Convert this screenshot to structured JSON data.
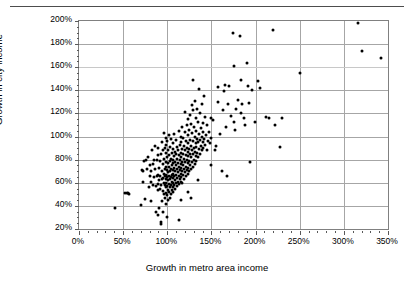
{
  "chart_data": {
    "type": "scatter",
    "title": "",
    "xlabel": "Growth in metro area income",
    "ylabel": "Growth in city income",
    "xlim": [
      0,
      350
    ],
    "ylim": [
      20,
      200
    ],
    "xtick_labels": [
      "0%",
      "50%",
      "100%",
      "150%",
      "200%",
      "250%",
      "300%",
      "350%"
    ],
    "xtick_values": [
      0,
      50,
      100,
      150,
      200,
      250,
      300,
      350
    ],
    "ytick_labels": [
      "20%",
      "40%",
      "60%",
      "80%",
      "100%",
      "120%",
      "140%",
      "160%",
      "180%",
      "200%"
    ],
    "ytick_values": [
      20,
      40,
      60,
      80,
      100,
      120,
      140,
      160,
      180,
      200
    ],
    "x_minor_tick_step": 10,
    "y_minor_tick_step": 5,
    "grid": {
      "vertical": true,
      "horizontal": true
    },
    "legend": null,
    "marker": {
      "shape": "circle",
      "color": "#000000",
      "size_px": 3
    },
    "units": "percent",
    "n_points": 268,
    "points": [
      [
        41,
        38
      ],
      [
        52,
        51
      ],
      [
        54,
        51
      ],
      [
        56,
        51
      ],
      [
        57,
        50
      ],
      [
        70,
        41
      ],
      [
        71,
        71
      ],
      [
        72,
        70
      ],
      [
        73,
        61
      ],
      [
        74,
        79
      ],
      [
        75,
        46
      ],
      [
        76,
        80
      ],
      [
        77,
        72
      ],
      [
        78,
        82
      ],
      [
        79,
        56
      ],
      [
        80,
        66
      ],
      [
        80,
        75
      ],
      [
        81,
        70
      ],
      [
        82,
        44
      ],
      [
        82,
        61
      ],
      [
        83,
        88
      ],
      [
        84,
        76
      ],
      [
        84,
        58
      ],
      [
        85,
        80
      ],
      [
        85,
        65
      ],
      [
        86,
        72
      ],
      [
        86,
        92
      ],
      [
        87,
        35
      ],
      [
        87,
        57
      ],
      [
        88,
        66
      ],
      [
        88,
        80
      ],
      [
        89,
        32
      ],
      [
        89,
        59
      ],
      [
        89,
        84
      ],
      [
        90,
        54
      ],
      [
        90,
        67
      ],
      [
        90,
        90
      ],
      [
        91,
        38
      ],
      [
        91,
        62
      ],
      [
        91,
        73
      ],
      [
        92,
        55
      ],
      [
        92,
        66
      ],
      [
        92,
        79
      ],
      [
        93,
        24
      ],
      [
        93,
        26
      ],
      [
        93,
        58
      ],
      [
        93,
        85
      ],
      [
        94,
        44
      ],
      [
        94,
        63
      ],
      [
        94,
        70
      ],
      [
        94,
        95
      ],
      [
        95,
        35
      ],
      [
        95,
        53
      ],
      [
        95,
        64
      ],
      [
        95,
        76
      ],
      [
        95,
        88
      ],
      [
        96,
        50
      ],
      [
        96,
        60
      ],
      [
        96,
        68
      ],
      [
        96,
        81
      ],
      [
        96,
        103
      ],
      [
        97,
        47
      ],
      [
        97,
        58
      ],
      [
        97,
        66
      ],
      [
        97,
        72
      ],
      [
        97,
        90
      ],
      [
        98,
        42
      ],
      [
        98,
        56
      ],
      [
        98,
        63
      ],
      [
        98,
        74
      ],
      [
        98,
        86
      ],
      [
        98,
        99
      ],
      [
        99,
        51
      ],
      [
        99,
        60
      ],
      [
        99,
        67
      ],
      [
        99,
        78
      ],
      [
        99,
        93
      ],
      [
        100,
        30
      ],
      [
        100,
        49
      ],
      [
        100,
        57
      ],
      [
        100,
        65
      ],
      [
        100,
        71
      ],
      [
        100,
        82
      ],
      [
        100,
        96
      ],
      [
        101,
        45
      ],
      [
        101,
        54
      ],
      [
        101,
        62
      ],
      [
        101,
        69
      ],
      [
        101,
        77
      ],
      [
        101,
        88
      ],
      [
        102,
        52
      ],
      [
        102,
        59
      ],
      [
        102,
        66
      ],
      [
        102,
        74
      ],
      [
        102,
        84
      ],
      [
        102,
        101
      ],
      [
        103,
        47
      ],
      [
        103,
        56
      ],
      [
        103,
        63
      ],
      [
        103,
        70
      ],
      [
        103,
        79
      ],
      [
        103,
        91
      ],
      [
        104,
        50
      ],
      [
        104,
        58
      ],
      [
        104,
        65
      ],
      [
        104,
        72
      ],
      [
        104,
        81
      ],
      [
        104,
        98
      ],
      [
        105,
        54
      ],
      [
        105,
        61
      ],
      [
        105,
        67
      ],
      [
        105,
        75
      ],
      [
        105,
        86
      ],
      [
        106,
        52
      ],
      [
        106,
        60
      ],
      [
        106,
        68
      ],
      [
        106,
        77
      ],
      [
        106,
        89
      ],
      [
        107,
        56
      ],
      [
        107,
        64
      ],
      [
        107,
        71
      ],
      [
        107,
        80
      ],
      [
        107,
        94
      ],
      [
        108,
        58
      ],
      [
        108,
        66
      ],
      [
        108,
        73
      ],
      [
        108,
        83
      ],
      [
        108,
        102
      ],
      [
        109,
        55
      ],
      [
        109,
        62
      ],
      [
        109,
        70
      ],
      [
        109,
        78
      ],
      [
        109,
        87
      ],
      [
        110,
        60
      ],
      [
        110,
        67
      ],
      [
        110,
        75
      ],
      [
        110,
        85
      ],
      [
        110,
        97
      ],
      [
        111,
        57
      ],
      [
        111,
        64
      ],
      [
        111,
        72
      ],
      [
        111,
        81
      ],
      [
        111,
        91
      ],
      [
        112,
        61
      ],
      [
        112,
        69
      ],
      [
        112,
        77
      ],
      [
        112,
        88
      ],
      [
        113,
        28
      ],
      [
        113,
        59
      ],
      [
        113,
        66
      ],
      [
        113,
        74
      ],
      [
        113,
        84
      ],
      [
        113,
        105
      ],
      [
        114,
        63
      ],
      [
        114,
        71
      ],
      [
        114,
        80
      ],
      [
        114,
        93
      ],
      [
        115,
        45
      ],
      [
        115,
        61
      ],
      [
        115,
        68
      ],
      [
        115,
        76
      ],
      [
        115,
        86
      ],
      [
        115,
        100
      ],
      [
        116,
        65
      ],
      [
        116,
        73
      ],
      [
        116,
        82
      ],
      [
        116,
        95
      ],
      [
        117,
        60
      ],
      [
        117,
        70
      ],
      [
        117,
        78
      ],
      [
        117,
        89
      ],
      [
        117,
        108
      ],
      [
        118,
        67
      ],
      [
        118,
        75
      ],
      [
        118,
        85
      ],
      [
        118,
        99
      ],
      [
        119,
        63
      ],
      [
        119,
        72
      ],
      [
        119,
        81
      ],
      [
        119,
        92
      ],
      [
        120,
        69
      ],
      [
        120,
        78
      ],
      [
        120,
        88
      ],
      [
        120,
        104
      ],
      [
        120,
        121
      ],
      [
        121,
        66
      ],
      [
        121,
        74
      ],
      [
        121,
        84
      ],
      [
        121,
        96
      ],
      [
        122,
        71
      ],
      [
        122,
        80
      ],
      [
        122,
        90
      ],
      [
        122,
        110
      ],
      [
        123,
        52
      ],
      [
        123,
        68
      ],
      [
        123,
        77
      ],
      [
        123,
        87
      ],
      [
        123,
        101
      ],
      [
        124,
        73
      ],
      [
        124,
        83
      ],
      [
        124,
        94
      ],
      [
        124,
        115
      ],
      [
        125,
        70
      ],
      [
        125,
        79
      ],
      [
        125,
        89
      ],
      [
        125,
        106
      ],
      [
        126,
        75
      ],
      [
        126,
        85
      ],
      [
        126,
        97
      ],
      [
        126,
        119
      ],
      [
        127,
        47
      ],
      [
        127,
        72
      ],
      [
        127,
        82
      ],
      [
        127,
        92
      ],
      [
        127,
        111
      ],
      [
        128,
        78
      ],
      [
        128,
        88
      ],
      [
        128,
        103
      ],
      [
        128,
        127
      ],
      [
        129,
        74
      ],
      [
        129,
        85
      ],
      [
        129,
        96
      ],
      [
        129,
        123
      ],
      [
        129,
        149
      ],
      [
        130,
        80
      ],
      [
        130,
        90
      ],
      [
        130,
        108
      ],
      [
        131,
        76
      ],
      [
        131,
        87
      ],
      [
        131,
        100
      ],
      [
        131,
        131
      ],
      [
        132,
        83
      ],
      [
        132,
        94
      ],
      [
        132,
        116
      ],
      [
        133,
        79
      ],
      [
        133,
        91
      ],
      [
        133,
        105
      ],
      [
        134,
        86
      ],
      [
        134,
        98
      ],
      [
        134,
        124
      ],
      [
        135,
        62
      ],
      [
        135,
        82
      ],
      [
        135,
        95
      ],
      [
        135,
        113
      ],
      [
        136,
        89
      ],
      [
        136,
        102
      ],
      [
        136,
        141
      ],
      [
        137,
        85
      ],
      [
        137,
        97
      ],
      [
        137,
        120
      ],
      [
        138,
        92
      ],
      [
        138,
        107
      ],
      [
        139,
        88
      ],
      [
        139,
        100
      ],
      [
        139,
        128
      ],
      [
        140,
        95
      ],
      [
        140,
        112
      ],
      [
        141,
        90
      ],
      [
        141,
        104
      ],
      [
        142,
        98
      ],
      [
        142,
        135
      ],
      [
        143,
        93
      ],
      [
        143,
        117
      ],
      [
        144,
        101
      ],
      [
        145,
        88
      ],
      [
        145,
        110
      ],
      [
        146,
        96
      ],
      [
        147,
        104
      ],
      [
        148,
        94
      ],
      [
        149,
        116
      ],
      [
        150,
        75
      ],
      [
        150,
        99
      ],
      [
        152,
        114
      ],
      [
        154,
        88
      ],
      [
        155,
        92
      ],
      [
        157,
        143
      ],
      [
        158,
        130
      ],
      [
        160,
        102
      ],
      [
        162,
        70
      ],
      [
        163,
        123
      ],
      [
        164,
        139
      ],
      [
        165,
        145
      ],
      [
        167,
        108
      ],
      [
        168,
        66
      ],
      [
        169,
        128
      ],
      [
        170,
        144
      ],
      [
        172,
        118
      ],
      [
        174,
        190
      ],
      [
        175,
        161
      ],
      [
        176,
        113
      ],
      [
        177,
        106
      ],
      [
        178,
        124
      ],
      [
        180,
        132
      ],
      [
        182,
        187
      ],
      [
        183,
        149
      ],
      [
        184,
        120
      ],
      [
        185,
        128
      ],
      [
        187,
        116
      ],
      [
        188,
        110
      ],
      [
        190,
        164
      ],
      [
        191,
        144
      ],
      [
        192,
        129
      ],
      [
        194,
        78
      ],
      [
        196,
        140
      ],
      [
        199,
        113
      ],
      [
        203,
        148
      ],
      [
        205,
        142
      ],
      [
        212,
        117
      ],
      [
        215,
        116
      ],
      [
        220,
        192
      ],
      [
        222,
        110
      ],
      [
        228,
        91
      ],
      [
        230,
        116
      ],
      [
        250,
        155
      ],
      [
        316,
        198
      ],
      [
        320,
        174
      ],
      [
        342,
        168
      ]
    ]
  },
  "axis_titles": {
    "x": "Growth in metro area income",
    "y": "Growth in city income"
  }
}
